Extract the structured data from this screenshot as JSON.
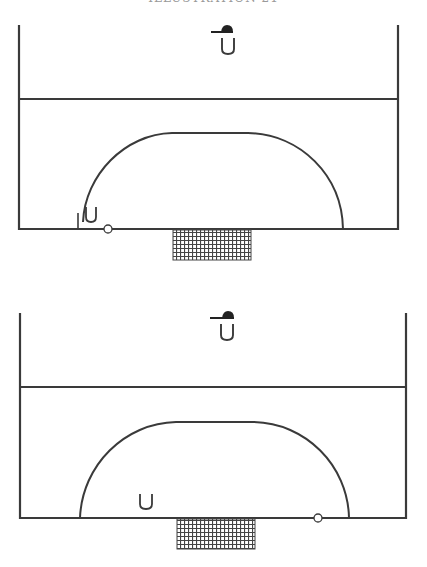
{
  "caption": "ILLUSTRATION 21",
  "colors": {
    "line": "#3a3a3a",
    "background": "#ffffff",
    "net": "#4a4a4a"
  },
  "legend": {
    "coach_symbol": "coach-with-cap-icon",
    "player_symbol": "U",
    "ball_symbol": "o"
  },
  "diagrams": [
    {
      "id": "diagram-1",
      "player_label": "U",
      "coach_label": "U",
      "description": "Player at left edge of arc near baseline, ball on baseline just right of player"
    },
    {
      "id": "diagram-2",
      "player_label": "U",
      "coach_label": "U",
      "description": "Player inside arc left of goal, ball on baseline right of goal near arc"
    }
  ]
}
